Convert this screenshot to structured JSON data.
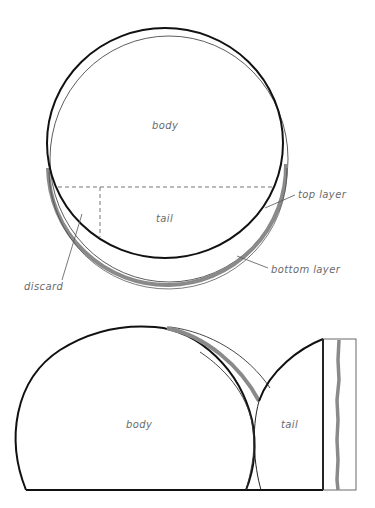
{
  "top_diagram": {
    "labels": {
      "body": "body",
      "tail": "tail",
      "top_layer": "top layer",
      "bottom_layer": "bottom layer",
      "discard": "discard"
    }
  },
  "bottom_diagram": {
    "labels": {
      "body": "body",
      "tail": "tail"
    }
  },
  "colors": {
    "outline": "#111111",
    "thin_outline": "#333333",
    "layer_band": "#8a8a8a",
    "label_text": "#6a6a6a",
    "dashed_line": "#777777"
  }
}
